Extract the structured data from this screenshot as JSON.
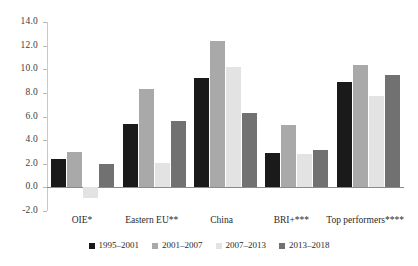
{
  "chart_data": {
    "type": "bar",
    "title": "",
    "subtitle": "",
    "xlabel": "",
    "ylabel": "",
    "ylim": [
      -2.0,
      14.0
    ],
    "ytick_step": 2.0,
    "yticks": [
      "14.0",
      "12.0",
      "10.0",
      "8.0",
      "6.0",
      "4.0",
      "2.0",
      "0.0",
      "-2.0"
    ],
    "ytick_values": [
      14.0,
      12.0,
      10.0,
      8.0,
      6.0,
      4.0,
      2.0,
      0.0,
      -2.0
    ],
    "grid": false,
    "zero_line": true,
    "legend_position": "bottom",
    "categories": [
      "OIE*",
      "Eastern EU**",
      "China",
      "BRI+***",
      "Top performers****"
    ],
    "series": [
      {
        "name": "1995–2001",
        "color": "#1a1a1a",
        "values": [
          2.4,
          5.4,
          9.3,
          2.9,
          8.9
        ]
      },
      {
        "name": "2001–2007",
        "color": "#a9a9a9",
        "values": [
          3.0,
          8.3,
          12.4,
          5.3,
          10.4
        ]
      },
      {
        "name": "2007–2013",
        "color": "#e3e3e3",
        "values": [
          -0.9,
          2.1,
          10.2,
          2.8,
          7.7
        ]
      },
      {
        "name": "2013–2018",
        "color": "#717171",
        "values": [
          2.0,
          5.6,
          6.3,
          3.2,
          9.5
        ]
      }
    ]
  },
  "colors": {
    "axis": "#c9c9c9",
    "zero_line": "#8a8a8a",
    "tick_label": "#3d3d3d",
    "text": "#2b2b2b",
    "background": "#ffffff"
  }
}
